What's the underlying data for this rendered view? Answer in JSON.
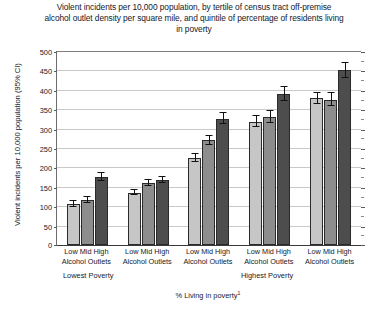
{
  "chart_data": {
    "type": "bar",
    "title": "Violent incidents per 10,000 population, by tertile of census tract off-premise alcohol outlet density per square mile, and quintile of percentage of residents living in poverty",
    "xlabel": "% Living in poverty",
    "xlabel_footnote": "1",
    "ylabel": "Violent incidents per 10,000 population (95% CI)",
    "ylim": [
      0,
      500
    ],
    "ytick_step": 50,
    "ytick_labels": [
      "500",
      "450",
      "400",
      "350",
      "300",
      "250",
      "200",
      "150",
      "100",
      "50",
      "0"
    ],
    "grid": true,
    "legend_position": "none",
    "categories": [
      "Lowest Poverty quintile",
      "Poverty quintile 2",
      "Poverty quintile 3",
      "Poverty quintile 4",
      "Highest Poverty quintile"
    ],
    "group_tick_labels": [
      "Low Mid High",
      "Low Mid High",
      "Low Mid High",
      "Low Mid High",
      "Low Mid High"
    ],
    "group_sublabels": [
      "Alcohol Outlets",
      "Alcohol Outlets",
      "Alcohol Outlets",
      "Alcohol Outlets",
      "Alcohol Outlets"
    ],
    "annotations": [
      {
        "text": "Lowest Poverty",
        "position": "below-group-1"
      },
      {
        "text": "Highest Poverty",
        "position": "below-group-4-5"
      }
    ],
    "series": [
      {
        "name": "Low",
        "color": "#c6c6c6",
        "values": [
          105,
          135,
          225,
          318,
          378
        ],
        "ci_low": [
          98,
          128,
          215,
          303,
          363
        ],
        "ci_high": [
          113,
          143,
          235,
          333,
          393
        ]
      },
      {
        "name": "Mid",
        "color": "#8d8d8d",
        "values": [
          116,
          160,
          270,
          330,
          375
        ],
        "ci_low": [
          109,
          152,
          259,
          314,
          358
        ],
        "ci_high": [
          124,
          168,
          281,
          346,
          392
        ]
      },
      {
        "name": "High",
        "color": "#4d4d4d",
        "values": [
          175,
          167,
          325,
          390,
          450
        ],
        "ci_low": [
          165,
          159,
          311,
          372,
          430
        ],
        "ci_high": [
          186,
          176,
          339,
          408,
          470
        ]
      }
    ]
  }
}
